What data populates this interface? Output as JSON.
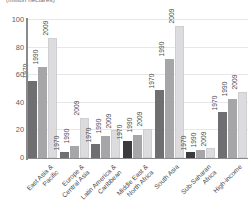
{
  "chart_data": {
    "type": "bar",
    "title": "(million hectares)",
    "xlabel": "",
    "ylabel": "",
    "ylim": [
      0,
      100
    ],
    "yticks": [
      0,
      20,
      40,
      60,
      80,
      100
    ],
    "grid": true,
    "legend": "none",
    "categories": [
      "East Asia & Pacific",
      "Europe & Central Asia",
      "Latin America & Caribbean",
      "Middle East & North Africa",
      "South Asia",
      "Sub-Saharan Africa",
      "High-income"
    ],
    "series": [
      {
        "name": "1970",
        "color": "#6f6f71",
        "values": [
          56,
          4,
          10,
          12,
          49,
          4,
          33
        ]
      },
      {
        "name": "1990",
        "color": "#a6a6a8",
        "values": [
          66,
          9,
          16,
          17,
          72,
          6,
          43
        ]
      },
      {
        "name": "2009",
        "color": "#dcdcde",
        "values": [
          87,
          29,
          20,
          21,
          96,
          7,
          48
        ]
      }
    ],
    "bar_overrides": [
      {
        "category": "Middle East & North Africa",
        "series": "1970",
        "color": "#3b3b3d"
      },
      {
        "category": "Sub-Saharan Africa",
        "series": "1970",
        "color": "#3b3b3d"
      }
    ]
  }
}
